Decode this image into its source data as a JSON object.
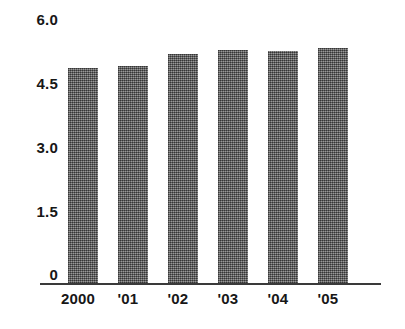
{
  "chart_data": {
    "type": "bar",
    "title": "",
    "subtitle": "",
    "xlabel": "",
    "ylabel": "",
    "categories": [
      "2000",
      "'01",
      "'02",
      "'03",
      "'04",
      "'05"
    ],
    "values": [
      4.8,
      4.85,
      5.1,
      5.2,
      5.18,
      5.25
    ],
    "series": [
      {
        "name": "",
        "values": [
          4.8,
          4.85,
          5.1,
          5.2,
          5.18,
          5.25
        ]
      }
    ],
    "ylim": [
      0,
      6.0
    ],
    "yticks": [
      0,
      1.5,
      3.0,
      4.5,
      6.0
    ],
    "ytick_labels": [
      "0",
      "1.5",
      "3.0",
      "4.5",
      "6.0"
    ],
    "xtick_labels": [
      "2000",
      "'01",
      "'02",
      "'03",
      "'04",
      "'05"
    ],
    "grid": false,
    "legend": null,
    "legend_position": "none",
    "bar_color": "#6e6e6e",
    "axis_color": "#3a3a3a",
    "text_color": "#171717",
    "background_color": "#ffffff",
    "annotations": []
  }
}
